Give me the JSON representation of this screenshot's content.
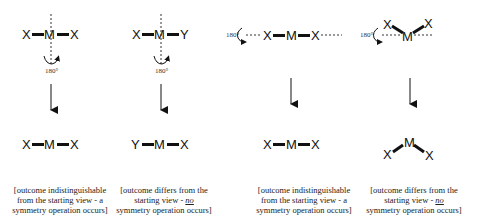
{
  "diagram": {
    "title": "",
    "angle_label": "180°",
    "panels": [
      {
        "id": "linear-perpendicular-axis",
        "axis": "vertical (perpendicular to bond axis)",
        "before": {
          "left": "X",
          "center": "M",
          "right": "X"
        },
        "after": {
          "left": "X",
          "center": "M",
          "right": "X"
        },
        "caption": {
          "line1": "[outcome indistinguishable",
          "line2": "from the starting view - a",
          "line3": "symmetry operation occurs]"
        }
      },
      {
        "id": "linear-asymmetric-perpendicular-axis",
        "axis": "vertical (perpendicular to bond axis)",
        "before": {
          "left": "X",
          "center": "M",
          "right": "Y"
        },
        "after": {
          "left": "Y",
          "center": "M",
          "right": "X"
        },
        "caption": {
          "line1": "[outcome differs from the",
          "line2a": "starting view - ",
          "line2b": "no",
          "line3": "symmetry operation occurs]"
        }
      },
      {
        "id": "linear-along-bond-axis",
        "axis": "horizontal (along bond axis)",
        "before": {
          "left": "X",
          "center": "M",
          "right": "X"
        },
        "after": {
          "left": "X",
          "center": "M",
          "right": "X"
        },
        "caption": {
          "line1": "[outcome indistinguishable",
          "line2": "from the starting view - a",
          "line3": "symmetry operation occurs]"
        }
      },
      {
        "id": "bent-horizontal-axis",
        "axis": "horizontal (through M)",
        "before": {
          "left": "X",
          "center": "M",
          "right": "X",
          "shape": "bent-up"
        },
        "after": {
          "left": "X",
          "center": "M",
          "right": "X",
          "shape": "bent-down"
        },
        "caption": {
          "line1": "[outcome differs from the",
          "line2a": "starting view - ",
          "line2b": "no",
          "line3": "symmetry operation occurs]"
        }
      }
    ]
  }
}
